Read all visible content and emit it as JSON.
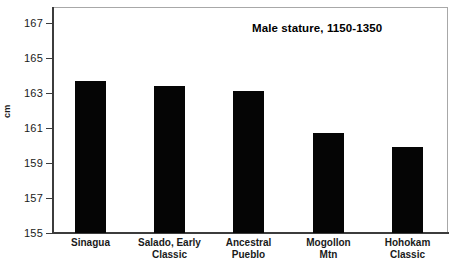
{
  "chart_data": {
    "type": "bar",
    "title": "Male stature, 1150-1350",
    "xlabel": "",
    "ylabel": "cm",
    "categories": [
      "Sinagua",
      "Salado, Early Classic",
      "Ancestral Pueblo",
      "Mogollon Mtn",
      "Hohokam Classic"
    ],
    "category_lines": [
      [
        "Sinagua",
        ""
      ],
      [
        "Salado, Early",
        "Classic"
      ],
      [
        "Ancestral",
        "Pueblo"
      ],
      [
        "Mogollon",
        "Mtn"
      ],
      [
        "Hohokam",
        "Classic"
      ]
    ],
    "values": [
      163.7,
      163.4,
      163.1,
      160.7,
      159.9
    ],
    "ylim": [
      155,
      167
    ],
    "ytick_values": [
      167,
      165,
      163,
      161,
      159,
      157,
      155
    ],
    "ytick_labels": [
      "167",
      "165",
      "163",
      "161",
      "159",
      "157",
      "155"
    ],
    "grid": false,
    "legend": null,
    "bar_color": "#050505",
    "frame_color": "#a8a8a8",
    "axis_color": "#3c3c3c",
    "background": "#ffffff"
  }
}
